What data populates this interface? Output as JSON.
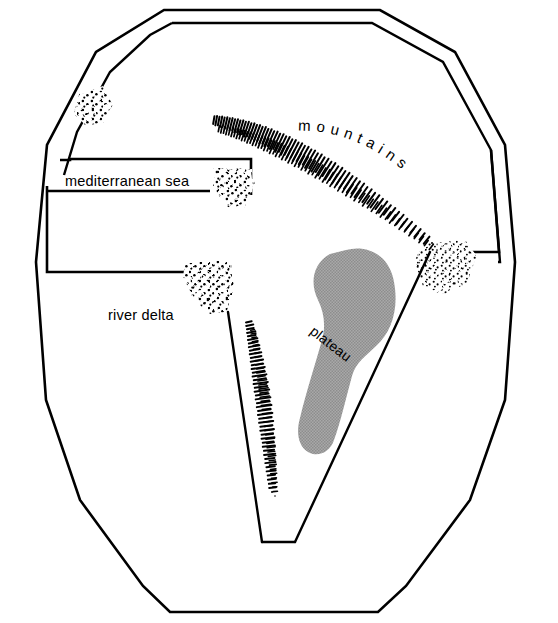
{
  "figure": {
    "type": "schematic-map",
    "background_color": "#ffffff",
    "ink_color": "#000000",
    "plateau_fill_color": "#9d9d9d",
    "width": 558,
    "height": 623
  },
  "labels": {
    "mediterranean_sea": "mediterranean sea",
    "mountains": "mountains",
    "plateau": "plateau",
    "river_delta": "river delta"
  },
  "features": [
    {
      "id": "landmass-outline",
      "name": "landmass outline",
      "style": "double-line polygon"
    },
    {
      "id": "mediterranean-sea",
      "name": "mediterranean sea",
      "style": "rectilinear inlet"
    },
    {
      "id": "mountains-upper",
      "name": "mountains",
      "style": "hachure ridge"
    },
    {
      "id": "mountains-lower",
      "name": "mountains",
      "style": "hachure ridge"
    },
    {
      "id": "plateau",
      "name": "plateau",
      "style": "gray stippled blob"
    },
    {
      "id": "river-delta",
      "name": "river delta",
      "style": "stipple triangle"
    },
    {
      "id": "rift-valley",
      "name": "rift valley",
      "style": "v-shaped outline"
    }
  ],
  "stipple_patches": [
    {
      "id": "stipple-northwest",
      "name": "northwest stipple patch"
    },
    {
      "id": "stipple-sea-mouth",
      "name": "sea mouth stipple patch"
    },
    {
      "id": "stipple-river-delta",
      "name": "river delta stipple patch"
    },
    {
      "id": "stipple-east",
      "name": "east coast stipple patch"
    }
  ]
}
